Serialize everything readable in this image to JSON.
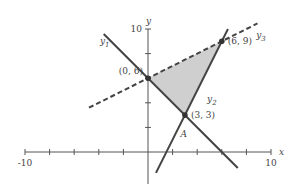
{
  "chart_data": {
    "type": "line",
    "title": "",
    "xlabel": "x",
    "ylabel": "y",
    "xlim": [
      -10,
      10
    ],
    "ylim": [
      -3,
      10
    ],
    "x_tick_step": 2,
    "y_tick_step": 2,
    "x_tick_labels": [
      {
        "value": -10,
        "text": "-10"
      },
      {
        "value": 10,
        "text": "10"
      }
    ],
    "y_tick_labels": [
      {
        "value": 10,
        "text": "10"
      }
    ],
    "grid": false,
    "colors": {
      "line": "#444444",
      "region": "#cfcfcf",
      "axis": "#555555"
    },
    "series": [
      {
        "name": "y1",
        "sub": "1",
        "equation": "y = 6 - x",
        "slope": -1,
        "intercept": 6,
        "x_range": [
          -3.6,
          7.3
        ],
        "style": "solid",
        "label_at": [
          -3.9,
          8.8
        ]
      },
      {
        "name": "y2",
        "sub": "2",
        "equation": "y = 2x - 3",
        "slope": 2,
        "intercept": -3,
        "x_range": [
          0.65,
          6.5
        ],
        "style": "solid",
        "label_at": [
          4.8,
          4.1
        ]
      },
      {
        "name": "y3",
        "sub": "3",
        "equation": "y = 0.5x + 6",
        "slope": 0.5,
        "intercept": 6,
        "x_range": [
          -4.8,
          8.9
        ],
        "style": "dashed",
        "label_at": [
          8.8,
          9.3
        ]
      }
    ],
    "shaded_region": [
      [
        0,
        6
      ],
      [
        6,
        9
      ],
      [
        3,
        3
      ]
    ],
    "points": [
      {
        "x": 0,
        "y": 6,
        "label": "(0, 6)",
        "anchor": "left"
      },
      {
        "x": 6,
        "y": 9,
        "label": "(6, 9)",
        "anchor": "right"
      },
      {
        "x": 3,
        "y": 3,
        "label": "(3, 3)",
        "anchor": "right"
      }
    ],
    "annotations": [
      {
        "text": "A",
        "x": 2.9,
        "y": 1.2
      }
    ]
  }
}
